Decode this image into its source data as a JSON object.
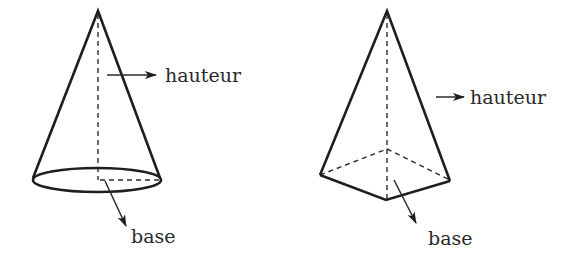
{
  "figures": [
    {
      "name": "cone",
      "labels": {
        "height": "hauteur",
        "base": "base"
      }
    },
    {
      "name": "pyramid",
      "labels": {
        "height": "hauteur",
        "base": "base"
      }
    }
  ],
  "colors": {
    "stroke": "#1e1e1e",
    "text": "#2a2a2a",
    "background": "#ffffff"
  }
}
